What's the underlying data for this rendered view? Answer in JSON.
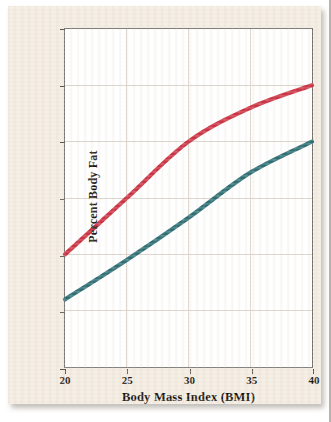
{
  "chart_data": {
    "type": "line",
    "title": "",
    "xlabel": "Body Mass Index (BMI)",
    "ylabel": "Percent Body Fat",
    "x": [
      20,
      25,
      30,
      35,
      40
    ],
    "xlim": [
      20,
      40
    ],
    "ylim": [
      0,
      60
    ],
    "xticks": [
      "20",
      "25",
      "30",
      "35",
      "40"
    ],
    "yticks": [
      "0",
      "10",
      "20",
      "30",
      "40",
      "50",
      "60"
    ],
    "grid": true,
    "legend": "none",
    "series": [
      {
        "name": "upper-curve",
        "color": "#cc3344",
        "values": [
          20,
          30,
          40,
          46,
          50
        ]
      },
      {
        "name": "lower-curve",
        "color": "#2e6f75",
        "values": [
          12,
          19,
          26.5,
          34.5,
          40
        ]
      }
    ]
  },
  "axes": {
    "x_label": "Body Mass Index (BMI)",
    "y_label": "Percent Body Fat",
    "x_ticks": [
      "20",
      "25",
      "30",
      "35",
      "40"
    ],
    "y_ticks": [
      "60",
      "50",
      "40",
      "30",
      "20",
      "10",
      "0"
    ]
  },
  "colors": {
    "paper": "#f3ece2",
    "plot_background": "#ffffff",
    "frame": "#6e6a66",
    "gridline": "#dcd6cd",
    "series_red": "#cc3344",
    "series_teal": "#2e6f75"
  }
}
